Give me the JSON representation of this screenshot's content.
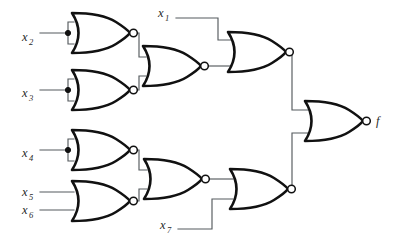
{
  "diagram": {
    "type": "logic-circuit",
    "colors": {
      "background": "#ffffff",
      "gate_outline": "#111111",
      "wire": "#555a5e",
      "label_text": "#2a2a2a"
    },
    "inputs": [
      {
        "id": "x1",
        "base": "x",
        "sub": "1",
        "x": 158,
        "y": 17
      },
      {
        "id": "x2",
        "base": "x",
        "sub": "2",
        "x": 22,
        "y": 41
      },
      {
        "id": "x3",
        "base": "x",
        "sub": "3",
        "x": 22,
        "y": 97
      },
      {
        "id": "x4",
        "base": "x",
        "sub": "4",
        "x": 22,
        "y": 157
      },
      {
        "id": "x5",
        "base": "x",
        "sub": "5",
        "x": 22,
        "y": 196
      },
      {
        "id": "x6",
        "base": "x",
        "sub": "6",
        "x": 22,
        "y": 213
      },
      {
        "id": "x7",
        "base": "x",
        "sub": "7",
        "x": 160,
        "y": 228
      }
    ],
    "outputs": [
      {
        "id": "f",
        "base": "f",
        "sub": "",
        "x": 375,
        "y": 124
      }
    ],
    "gates": [
      {
        "id": "g1",
        "kind": "NOR",
        "label": "nor-gate-x2",
        "inputs": [
          "x2",
          "x2"
        ],
        "output": "n1"
      },
      {
        "id": "g2",
        "kind": "NOR",
        "label": "nor-gate-x3",
        "inputs": [
          "x3",
          "x3"
        ],
        "output": "n2"
      },
      {
        "id": "g3",
        "kind": "NOR",
        "label": "nor-gate-x4",
        "inputs": [
          "x4",
          "x4"
        ],
        "output": "n3"
      },
      {
        "id": "g4",
        "kind": "NOR",
        "label": "nor-gate-x5-x6",
        "inputs": [
          "x5",
          "x6"
        ],
        "output": "n4"
      },
      {
        "id": "g5",
        "kind": "NOR",
        "label": "nor-gate-mid-upper",
        "inputs": [
          "n1",
          "n2"
        ],
        "output": "n5"
      },
      {
        "id": "g6",
        "kind": "NOR",
        "label": "nor-gate-mid-lower",
        "inputs": [
          "n3",
          "n4"
        ],
        "output": "n6"
      },
      {
        "id": "g7",
        "kind": "NOR",
        "label": "nor-gate-upper-x1",
        "inputs": [
          "x1",
          "n5"
        ],
        "output": "n7"
      },
      {
        "id": "g8",
        "kind": "NOR",
        "label": "nor-gate-lower-x7",
        "inputs": [
          "n6",
          "x7"
        ],
        "output": "n8"
      },
      {
        "id": "g9",
        "kind": "NOR",
        "label": "nor-gate-output",
        "inputs": [
          "n7",
          "n8"
        ],
        "output": "f"
      }
    ],
    "junctions": [
      {
        "id": "j-x2",
        "x": 68,
        "y": 33
      },
      {
        "id": "j-x3",
        "x": 68,
        "y": 90
      },
      {
        "id": "j-x4",
        "x": 68,
        "y": 150
      }
    ]
  }
}
